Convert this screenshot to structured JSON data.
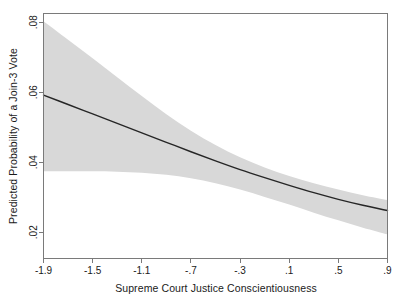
{
  "chart_data": {
    "type": "line",
    "title": "",
    "subtitle": "",
    "xlabel": "Supreme Court Justice Conscientiousness",
    "ylabel": "Predicted Probability of a Join-3 Vote",
    "xlim": [
      -1.9,
      0.9
    ],
    "ylim": [
      0.0125,
      0.0825
    ],
    "xticks": [
      -1.9,
      -1.5,
      -1.1,
      -0.7,
      -0.3,
      0.1,
      0.5,
      0.9
    ],
    "xticklabels": [
      "-1.9",
      "-1.5",
      "-1.1",
      "-.7",
      "-.3",
      ".1",
      ".5",
      ".9"
    ],
    "yticks": [
      0.02,
      0.04,
      0.06,
      0.08
    ],
    "yticklabels": [
      ".02",
      ".04",
      ".06",
      ".08"
    ],
    "grid": false,
    "legend": null,
    "x": [
      -1.9,
      -1.7,
      -1.5,
      -1.3,
      -1.1,
      -0.9,
      -0.7,
      -0.5,
      -0.3,
      -0.1,
      0.1,
      0.3,
      0.5,
      0.7,
      0.9
    ],
    "series": [
      {
        "name": "Predicted probability",
        "role": "fit-line",
        "color": "#262626",
        "linewidth": 1.4,
        "values": [
          0.0592,
          0.0565,
          0.0538,
          0.0511,
          0.0484,
          0.0457,
          0.043,
          0.0404,
          0.0379,
          0.0356,
          0.0334,
          0.0313,
          0.0294,
          0.0277,
          0.0262
        ]
      },
      {
        "name": "95% confidence interval upper bound",
        "role": "ci-upper",
        "color": "#d8d8d8",
        "values": [
          0.0803,
          0.075,
          0.0697,
          0.0643,
          0.0589,
          0.0537,
          0.049,
          0.0449,
          0.0414,
          0.0385,
          0.0361,
          0.034,
          0.0322,
          0.0306,
          0.0292
        ]
      },
      {
        "name": "95% confidence interval lower bound",
        "role": "ci-lower",
        "color": "#d8d8d8",
        "values": [
          0.0374,
          0.0374,
          0.0374,
          0.0373,
          0.037,
          0.0364,
          0.0354,
          0.034,
          0.0322,
          0.0301,
          0.0279,
          0.0256,
          0.0234,
          0.0213,
          0.0194
        ]
      }
    ],
    "band_fill_color": "#d8d8d8",
    "line_color": "#262626",
    "frame_color": "#7a7a7a",
    "background_color": "#ffffff"
  }
}
